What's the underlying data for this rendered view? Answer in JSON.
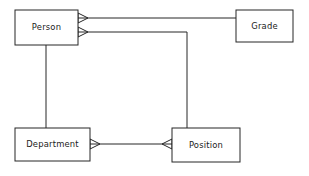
{
  "diagram": {
    "type": "entity-relationship-diagram",
    "notation": "crow's foot",
    "background_color": "#ffffff",
    "line_color": "#262626",
    "text_color": "#1a1a1a",
    "entities": [
      {
        "id": "person",
        "label": "Person",
        "x": 15,
        "y": 10,
        "width": 63,
        "height": 35
      },
      {
        "id": "grade",
        "label": "Grade",
        "x": 236,
        "y": 10,
        "width": 57,
        "height": 32
      },
      {
        "id": "department",
        "label": "Department",
        "x": 15,
        "y": 128,
        "width": 75,
        "height": 33
      },
      {
        "id": "position",
        "label": "Position",
        "x": 172,
        "y": 128,
        "width": 68,
        "height": 34
      }
    ],
    "relationships": [
      {
        "id": "person-grade",
        "from": "person",
        "to": "grade",
        "from_cardinality": "many",
        "to_cardinality": "one"
      },
      {
        "id": "person-position",
        "from": "person",
        "to": "position",
        "from_cardinality": "many",
        "to_cardinality": "one"
      },
      {
        "id": "person-department",
        "from": "person",
        "to": "department",
        "from_cardinality": "one",
        "to_cardinality": "one"
      },
      {
        "id": "department-position",
        "from": "department",
        "to": "position",
        "from_cardinality": "many",
        "to_cardinality": "many"
      }
    ]
  }
}
